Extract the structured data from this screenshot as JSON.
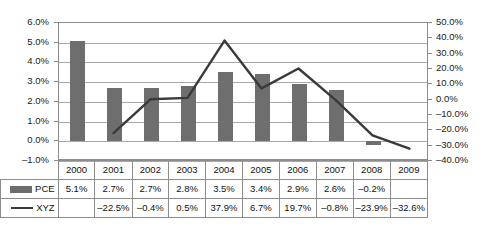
{
  "chart_data": {
    "type": "bar",
    "title": "",
    "subtitle": "",
    "xlabel": "",
    "ylabel": "",
    "grid": true,
    "legend_position": "table-left",
    "categories": [
      "2000",
      "2001",
      "2002",
      "2003",
      "2004",
      "2005",
      "2006",
      "2007",
      "2008",
      "2009"
    ],
    "series": [
      {
        "name": "PCE",
        "type": "bar",
        "axis": "left",
        "color": "#6e6e6e",
        "values": [
          5.1,
          2.7,
          2.7,
          2.8,
          3.5,
          3.4,
          2.9,
          2.6,
          -0.2,
          null
        ],
        "labels": [
          "5.1%",
          "2.7%",
          "2.7%",
          "2.8%",
          "3.5%",
          "3.4%",
          "2.9%",
          "2.6%",
          "-0.2%",
          ""
        ]
      },
      {
        "name": "XYZ",
        "type": "line",
        "axis": "right",
        "color": "#3a3a3a",
        "values": [
          null,
          -22.5,
          -0.4,
          0.5,
          37.9,
          6.7,
          19.7,
          -0.8,
          -23.9,
          -32.6
        ],
        "labels": [
          "",
          "-22.5%",
          "-0.4%",
          "0.5%",
          "37.9%",
          "6.7%",
          "19.7%",
          "-0.8%",
          "-23.9%",
          "-32.6%"
        ]
      }
    ],
    "left_axis": {
      "min": -1.0,
      "max": 6.0,
      "step": 1.0,
      "ticks": [
        "6.0%",
        "5.0%",
        "4.0%",
        "3.0%",
        "2.0%",
        "1.0%",
        "0.0%",
        "-1.0%"
      ]
    },
    "right_axis": {
      "min": -40.0,
      "max": 50.0,
      "step": 10.0,
      "ticks": [
        "50.0%",
        "40.0%",
        "30.0%",
        "20.0%",
        "10.0%",
        "0.0%",
        "-10.0%",
        "-20.0%",
        "-30.0%",
        "-40.0%"
      ]
    }
  },
  "table": {
    "header_corner": "",
    "years": [
      "2000",
      "2001",
      "2002",
      "2003",
      "2004",
      "2005",
      "2006",
      "2007",
      "2008",
      "2009"
    ],
    "rows": [
      {
        "label": "PCE",
        "swatch": "bar-swatch",
        "cells": [
          "5.1%",
          "2.7%",
          "2.7%",
          "2.8%",
          "3.5%",
          "3.4%",
          "2.9%",
          "2.6%",
          "-0.2%",
          ""
        ]
      },
      {
        "label": "XYZ",
        "swatch": "line-swatch",
        "cells": [
          "",
          "-22.5%",
          "-0.4%",
          "0.5%",
          "37.9%",
          "6.7%",
          "19.7%",
          "-0.8%",
          "-23.9%",
          "-32.6%"
        ]
      }
    ]
  },
  "colors": {
    "bar": "#6e6e6e",
    "line": "#3a3a3a",
    "grid": "#a8a8a8",
    "axis": "#8c8c8c",
    "text": "#111111",
    "background": "#ffffff"
  }
}
